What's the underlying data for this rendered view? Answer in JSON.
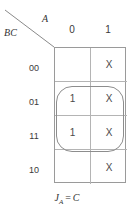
{
  "diagram": {
    "type": "karnaugh-map",
    "corner": {
      "row_variable_label": "BC",
      "col_variable_label": "A",
      "divider": "diagonal-line"
    },
    "columns": {
      "variable": "A",
      "headers": [
        "0",
        "1"
      ]
    },
    "rows": {
      "variable": "BC",
      "headers": [
        "00",
        "01",
        "11",
        "10"
      ]
    },
    "cells": [
      {
        "row": "00",
        "col": "0",
        "value": ""
      },
      {
        "row": "00",
        "col": "1",
        "value": "X"
      },
      {
        "row": "01",
        "col": "0",
        "value": "1"
      },
      {
        "row": "01",
        "col": "1",
        "value": "X"
      },
      {
        "row": "11",
        "col": "0",
        "value": "1"
      },
      {
        "row": "11",
        "col": "1",
        "value": "X"
      },
      {
        "row": "10",
        "col": "0",
        "value": ""
      },
      {
        "row": "10",
        "col": "1",
        "value": "X"
      }
    ],
    "groups": [
      {
        "name": "group-oval",
        "covers_rows": [
          "01",
          "11"
        ],
        "covers_cols": [
          "0",
          "1"
        ],
        "shape": "rounded-rectangle"
      }
    ],
    "caption": {
      "function": "J",
      "subscript": "A",
      "operator": "=",
      "expression": "C",
      "full_text": "J_A = C"
    },
    "colors": {
      "grid_line": "#b4b4b4",
      "outer_border": "#9a9a9a",
      "group_outline": "#8d8d8d",
      "text": "#3a3a3a",
      "background": "#ffffff"
    }
  }
}
